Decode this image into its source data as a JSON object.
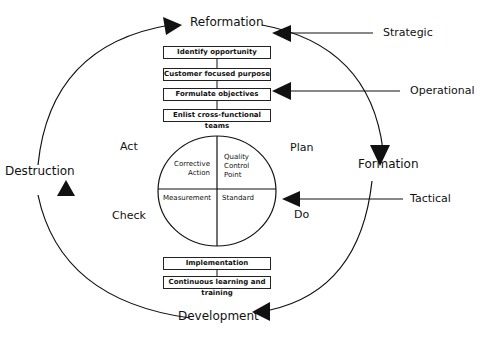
{
  "cycle_labels": {
    "top": "Reformation",
    "right": "Formation",
    "bottom": "Development",
    "left": "Destruction"
  },
  "levels": {
    "strategic": "Strategic",
    "operational": "Operational",
    "tactical": "Tactical"
  },
  "pdca": {
    "plan": "Plan",
    "do": "Do",
    "check": "Check",
    "act": "Act"
  },
  "top_boxes": [
    "Identify opportunity",
    "Customer focused purpose",
    "Formulate objectives",
    "Enlist cross-functional teams"
  ],
  "bottom_boxes": [
    "Implementation",
    "Continuous learning and training"
  ],
  "quadrants": {
    "top_left": [
      "Corrective",
      "Action"
    ],
    "top_right": [
      "Quality",
      "Control",
      "Point"
    ],
    "bottom_left": "Measurement",
    "bottom_right": "Standard"
  }
}
